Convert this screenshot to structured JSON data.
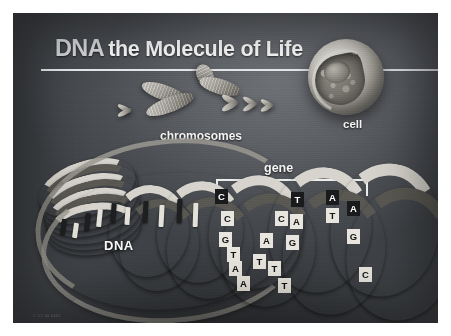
{
  "poster": {
    "title_primary": "DNA",
    "title_secondary": "the Molecule of Life",
    "credit": "© CC 00 0401"
  },
  "labels": {
    "chromosomes": "chromosomes",
    "cell": "cell",
    "gene": "gene",
    "dna": "DNA"
  },
  "diagram": {
    "colors": {
      "background_dark": "#4b4e53",
      "plate_edge": "#3d4044",
      "text_light": "#fdfdfd",
      "rule": "#e9eaec",
      "ribbon_light": "#d7d4cd",
      "ribbon_dark": "#5a5852",
      "base_dark_tile": "#191a1c",
      "base_light_tile": "#e9e6df",
      "frame": "#ffffff"
    },
    "elements": [
      {
        "name": "cell",
        "description": "cutaway spherical cell showing nucleus"
      },
      {
        "name": "chromosomes",
        "description": "one large X-shaped chromosome with smaller chromosomes"
      },
      {
        "name": "dna-helix",
        "description": "double helix unwinding from a coiled loop"
      },
      {
        "name": "gene-bracket",
        "description": "bracket marking a gene segment along the helix"
      }
    ],
    "base_pairs": [
      {
        "top": "C",
        "bottom": "G"
      },
      {
        "top": "C",
        "bottom": "G"
      },
      {
        "top": "G",
        "bottom": "C"
      },
      {
        "top": "T",
        "bottom": "A"
      },
      {
        "top": "A",
        "bottom": "T"
      },
      {
        "top": "A",
        "bottom": "T"
      },
      {
        "top": "T",
        "bottom": "A"
      },
      {
        "top": "C",
        "bottom": "G"
      },
      {
        "top": "A",
        "bottom": "T"
      },
      {
        "top": "G",
        "bottom": "C"
      },
      {
        "top": "T",
        "bottom": "A"
      },
      {
        "top": "T",
        "bottom": "A"
      },
      {
        "top": "T",
        "bottom": "A"
      },
      {
        "top": "A",
        "bottom": "T"
      },
      {
        "top": "G",
        "bottom": "C"
      }
    ],
    "visible_base_letters": [
      "C",
      "C",
      "G",
      "T",
      "A",
      "A",
      "T",
      "C",
      "A",
      "A",
      "G",
      "T",
      "T",
      "T",
      "A",
      "T",
      "A",
      "G",
      "C"
    ]
  }
}
